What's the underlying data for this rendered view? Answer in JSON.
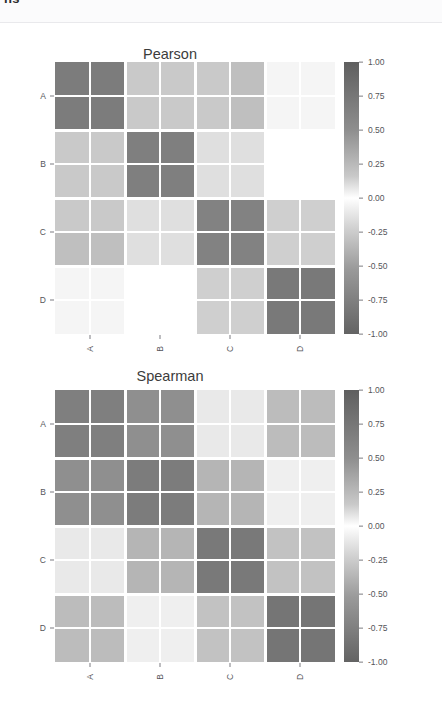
{
  "top_strip": {
    "clipped_heading": "ns"
  },
  "figure": {
    "panels": [
      {
        "id": "pearson",
        "title": "Pearson",
        "y_labels": [
          "A",
          "B",
          "C",
          "D"
        ],
        "x_labels": [
          "A",
          "B",
          "C",
          "D"
        ]
      },
      {
        "id": "spearman",
        "title": "Spearman",
        "y_labels": [
          "A",
          "B",
          "C",
          "D"
        ],
        "x_labels": [
          "A",
          "B",
          "C",
          "D"
        ]
      }
    ],
    "colorbar": {
      "ticks": [
        "1.00",
        "0.75",
        "0.50",
        "0.25",
        "0.00",
        "-0.25",
        "-0.50",
        "-0.75",
        "-1.00"
      ],
      "vmin": -1.0,
      "vmax": 1.0,
      "colormap": "gray-diverging",
      "high_color": "#5f5f5f",
      "mid_color": "#ffffff",
      "low_color": "#636363"
    }
  },
  "chart_data": [
    {
      "type": "heatmap",
      "title": "Pearson",
      "xlabel": "",
      "ylabel": "",
      "xticklabels": [
        "A",
        "B",
        "C",
        "D"
      ],
      "yticklabels": [
        "A",
        "B",
        "C",
        "D"
      ],
      "row_labels": [
        "A1",
        "A2",
        "B1",
        "B2",
        "C1",
        "C2",
        "D1",
        "D2"
      ],
      "col_labels": [
        "A1",
        "A2",
        "B1",
        "B2",
        "C1",
        "C2",
        "D1",
        "D2"
      ],
      "vmin": -1.0,
      "vmax": 1.0,
      "colorbar_ticks": [
        1.0,
        0.75,
        0.5,
        0.25,
        0.0,
        -0.25,
        -0.5,
        -0.75,
        -1.0
      ],
      "grid": true,
      "legend": "colorbar-right",
      "values": [
        [
          0.82,
          0.82,
          0.34,
          0.34,
          0.34,
          0.4,
          0.06,
          0.06
        ],
        [
          0.82,
          0.82,
          0.34,
          0.34,
          0.34,
          0.4,
          0.06,
          0.06
        ],
        [
          0.34,
          0.34,
          0.8,
          0.8,
          0.2,
          0.2,
          0.0,
          0.0
        ],
        [
          0.34,
          0.34,
          0.8,
          0.8,
          0.2,
          0.2,
          0.0,
          0.0
        ],
        [
          0.34,
          0.34,
          0.2,
          0.2,
          0.78,
          0.78,
          0.3,
          0.3
        ],
        [
          0.4,
          0.4,
          0.2,
          0.2,
          0.78,
          0.78,
          0.3,
          0.3
        ],
        [
          0.06,
          0.06,
          0.0,
          0.0,
          0.3,
          0.3,
          0.84,
          0.84
        ],
        [
          0.06,
          0.06,
          0.0,
          0.0,
          0.3,
          0.3,
          0.84,
          0.84
        ]
      ]
    },
    {
      "type": "heatmap",
      "title": "Spearman",
      "xlabel": "",
      "ylabel": "",
      "xticklabels": [
        "A",
        "B",
        "C",
        "D"
      ],
      "yticklabels": [
        "A",
        "B",
        "C",
        "D"
      ],
      "row_labels": [
        "A1",
        "A2",
        "B1",
        "B2",
        "C1",
        "C2",
        "D1",
        "D2"
      ],
      "col_labels": [
        "A1",
        "A2",
        "B1",
        "B2",
        "C1",
        "C2",
        "D1",
        "D2"
      ],
      "vmin": -1.0,
      "vmax": 1.0,
      "colorbar_ticks": [
        1.0,
        0.75,
        0.5,
        0.25,
        0.0,
        -0.25,
        -0.5,
        -0.75,
        -1.0
      ],
      "grid": true,
      "legend": "colorbar-right",
      "values": [
        [
          0.8,
          0.8,
          0.7,
          0.7,
          0.14,
          0.14,
          0.42,
          0.42
        ],
        [
          0.8,
          0.8,
          0.7,
          0.7,
          0.14,
          0.14,
          0.42,
          0.42
        ],
        [
          0.7,
          0.7,
          0.82,
          0.82,
          0.46,
          0.46,
          0.1,
          0.1
        ],
        [
          0.7,
          0.7,
          0.82,
          0.82,
          0.46,
          0.46,
          0.1,
          0.1
        ],
        [
          0.14,
          0.14,
          0.46,
          0.46,
          0.84,
          0.84,
          0.38,
          0.38
        ],
        [
          0.14,
          0.14,
          0.46,
          0.46,
          0.84,
          0.84,
          0.38,
          0.38
        ],
        [
          0.42,
          0.42,
          0.1,
          0.1,
          0.38,
          0.38,
          0.86,
          0.86
        ],
        [
          0.42,
          0.42,
          0.1,
          0.1,
          0.38,
          0.38,
          0.86,
          0.86
        ]
      ]
    }
  ]
}
